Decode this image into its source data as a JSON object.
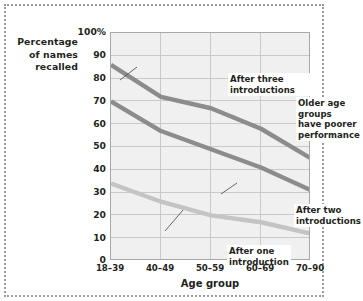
{
  "figure": {
    "ylabel_lines": "Percentage\nof names\nrecalled",
    "xlabel": "Age group"
  },
  "chart_data": {
    "type": "line",
    "title": "",
    "xlabel": "Age group",
    "ylabel": "Percentage of names recalled",
    "categories": [
      "18–39",
      "40–49",
      "50–59",
      "60–69",
      "70–90"
    ],
    "ylim": [
      0,
      100
    ],
    "yticks": [
      0,
      10,
      20,
      30,
      40,
      50,
      60,
      70,
      80,
      90,
      100
    ],
    "ytick_labels": [
      "0",
      "10",
      "20",
      "30",
      "40",
      "50",
      "60",
      "70",
      "80",
      "90",
      "100%"
    ],
    "grid": true,
    "legend": "none",
    "series": [
      {
        "name": "After three introductions",
        "color": "#8c8c8c",
        "values": [
          86,
          72,
          67,
          58,
          45
        ]
      },
      {
        "name": "After two introductions",
        "color": "#8c8c8c",
        "values": [
          70,
          57,
          49,
          41,
          31
        ]
      },
      {
        "name": "After one introduction",
        "color": "#c4c4c4",
        "values": [
          34,
          26,
          20,
          17,
          12
        ]
      }
    ],
    "annotations": [
      {
        "id": "three",
        "text": "After three introductions",
        "target_series": "After three introductions"
      },
      {
        "id": "older",
        "text": "Older age groups\nhave poorer performance",
        "target_series": ""
      },
      {
        "id": "two",
        "text": "After two\nintroductions",
        "target_series": "After two introductions"
      },
      {
        "id": "one",
        "text": "After one\nintroduction",
        "target_series": "After one introduction"
      }
    ]
  },
  "colors": {
    "plot_background": "#f0f0f0",
    "grid": "#c9c9c9",
    "axis": "#a8a8a8",
    "text": "#231f20",
    "frame": "#9a9a9a"
  }
}
